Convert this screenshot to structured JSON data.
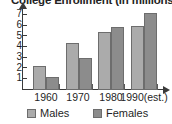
{
  "chart_data": {
    "type": "bar",
    "title": "College Enrollment (in millions)",
    "xlabel": "",
    "ylabel": "",
    "ylim": [
      0,
      7.6
    ],
    "yticks": [
      1,
      2,
      3,
      4,
      5,
      6,
      7
    ],
    "grid": false,
    "legend_position": "bottom",
    "categories": [
      "1960",
      "1970",
      "1980",
      "1990(est.)"
    ],
    "series": [
      {
        "name": "Males",
        "color": "#ababab",
        "values": [
          2.3,
          4.4,
          5.4,
          6.0
        ]
      },
      {
        "name": "Females",
        "color": "#8c8c8c",
        "values": [
          1.2,
          3.0,
          5.9,
          7.2
        ]
      }
    ]
  },
  "axis": {
    "y_tick_labels": [
      "7",
      "6",
      "5",
      "4",
      "3",
      "2",
      "1"
    ]
  },
  "legend": {
    "items": [
      {
        "label": "Males"
      },
      {
        "label": "Females"
      }
    ]
  }
}
